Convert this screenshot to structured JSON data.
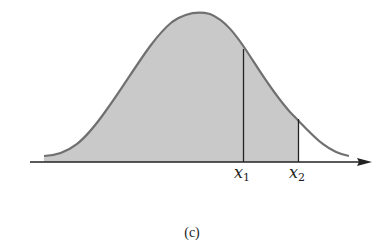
{
  "figure": {
    "type": "normal-distribution-curve",
    "caption": "(c)",
    "fill_color": "#c8c8c8",
    "curve_color": "#6e6e6e",
    "axis_color": "#222222",
    "markers": [
      {
        "label_main": "x",
        "label_sub": "1"
      },
      {
        "label_main": "x",
        "label_sub": "2"
      }
    ],
    "shaded_region": "area under curve to the left of x2"
  }
}
